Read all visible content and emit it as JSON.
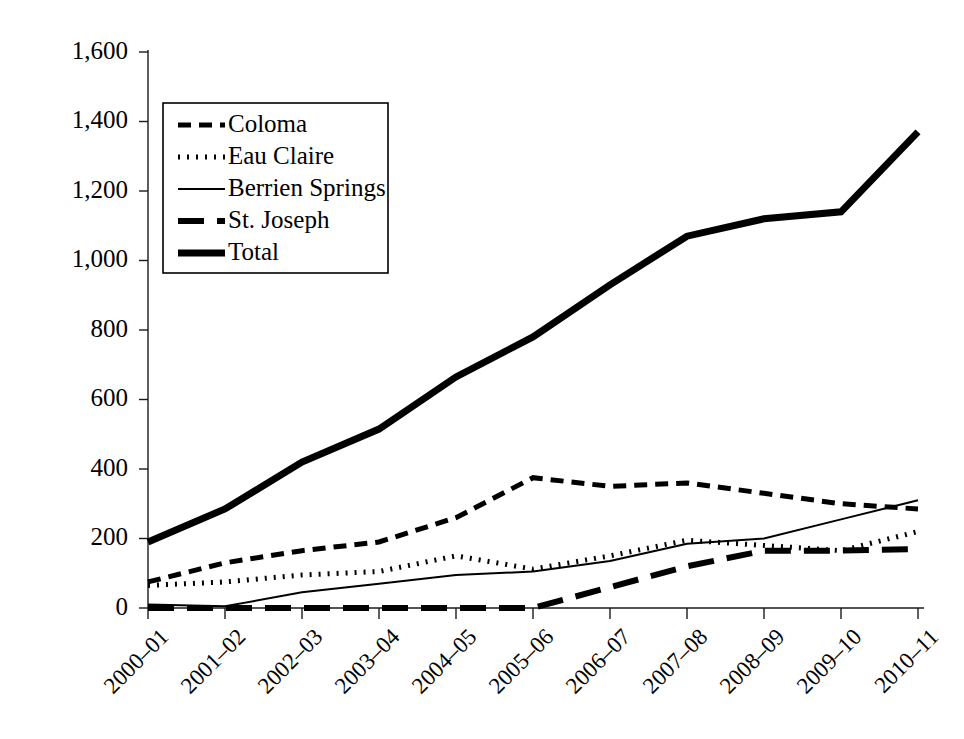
{
  "chart_data": {
    "type": "line",
    "title": "",
    "xlabel": "",
    "ylabel": "",
    "grid": false,
    "legend_position": "upper-left-inside",
    "ylim": [
      0,
      1600
    ],
    "ytick_step": 200,
    "categories": [
      "2000–01",
      "2001–02",
      "2002–03",
      "2003–04",
      "2004–05",
      "2005–06",
      "2006–07",
      "2007–08",
      "2008–09",
      "2009–10",
      "2010–11"
    ],
    "ytick_labels": [
      "0",
      "200",
      "400",
      "600",
      "800",
      "1,000",
      "1,200",
      "1,400",
      "1,600"
    ],
    "ytick_values": [
      0,
      200,
      400,
      600,
      800,
      1000,
      1200,
      1400,
      1600
    ],
    "series": [
      {
        "name": "Coloma",
        "style": "short-dash",
        "dasharray": "13,8",
        "width": 5,
        "values": [
          75,
          130,
          165,
          190,
          260,
          375,
          350,
          360,
          330,
          300,
          285
        ]
      },
      {
        "name": "Eau Claire",
        "style": "dotted",
        "dasharray": "2,7",
        "width": 5,
        "values": [
          65,
          75,
          95,
          105,
          150,
          112,
          150,
          195,
          180,
          165,
          220
        ]
      },
      {
        "name": "Berrien Springs",
        "style": "thin-solid",
        "dasharray": "none",
        "width": 2,
        "values": [
          10,
          5,
          45,
          70,
          95,
          105,
          135,
          185,
          200,
          255,
          310
        ]
      },
      {
        "name": "St. Joseph",
        "style": "long-dash",
        "dasharray": "26,13",
        "width": 6,
        "values": [
          0,
          0,
          0,
          0,
          0,
          0,
          60,
          120,
          165,
          165,
          170
        ]
      },
      {
        "name": "Total",
        "style": "thick-solid",
        "dasharray": "none",
        "width": 7,
        "values": [
          190,
          285,
          420,
          515,
          665,
          780,
          930,
          1070,
          1120,
          1140,
          1370
        ]
      }
    ]
  },
  "legend": {
    "entries": [
      {
        "label": "Coloma"
      },
      {
        "label": "Eau Claire"
      },
      {
        "label": "Berrien Springs"
      },
      {
        "label": "St. Joseph"
      },
      {
        "label": "Total"
      }
    ]
  },
  "colors": {
    "ink": "#000000",
    "axis": "#1a1a1a",
    "background": "#ffffff"
  }
}
